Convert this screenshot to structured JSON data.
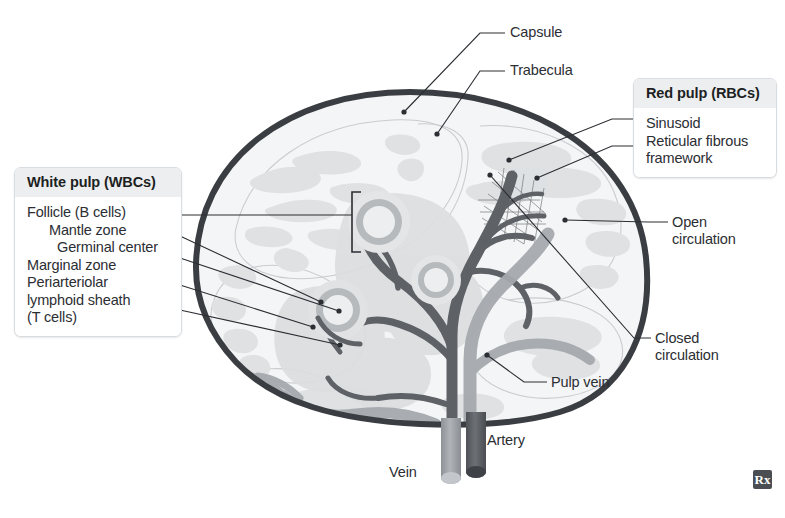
{
  "figure": {
    "background_color": "#ffffff"
  },
  "callouts": [
    {
      "id": "white-pulp",
      "title": "White pulp (WBCs)",
      "items": [
        {
          "label": "Follicle (B cells)",
          "indent": 0
        },
        {
          "label": "Mantle zone",
          "indent": 1
        },
        {
          "label": "Germinal center",
          "indent": 2
        },
        {
          "label": "Marginal zone",
          "indent": 0
        },
        {
          "label": "Periarteriolar",
          "indent": 0
        },
        {
          "label": "lymphoid sheath",
          "indent": 0
        },
        {
          "label": "(T cells)",
          "indent": 0
        }
      ]
    },
    {
      "id": "red-pulp",
      "title": "Red pulp (RBCs)",
      "items": [
        {
          "label": "Sinusoid",
          "indent": 0
        },
        {
          "label": "Reticular fibrous",
          "indent": 0
        },
        {
          "label": "framework",
          "indent": 0
        }
      ]
    }
  ],
  "labels": {
    "capsule": "Capsule",
    "trabecula": "Trabecula",
    "open_circulation": "Open\ncirculation",
    "closed_circulation": "Closed\ncirculation",
    "pulp_vein": "Pulp vein",
    "artery": "Artery",
    "vein": "Vein"
  },
  "badge": {
    "text": "Rx"
  },
  "colors": {
    "capsule_outline": "#3a3d42",
    "red_pulp_fill": "#f2f3f4",
    "white_pulp_fill": "#dcdee0",
    "sinusoid_fill": "#d5d8da",
    "follicle_ring": "#b6babd",
    "follicle_center": "#eceeef",
    "artery_dark": "#5e6166",
    "vein_light": "#9ca0a5",
    "leader_line": "#2b2e33",
    "text": "#2b2e33",
    "header_bg": "#eceef0",
    "box_border": "#d8dde2",
    "badge_bg": "#4a4d52"
  }
}
